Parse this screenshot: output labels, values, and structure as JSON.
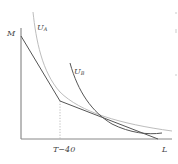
{
  "diagram": {
    "type": "labor-leisure budget constraint with indifference curves",
    "labels": {
      "y_axis": "M",
      "x_axis": "L",
      "kink_tick": "T−40",
      "curve_a": "U",
      "curve_a_sub": "A",
      "curve_b": "U",
      "curve_b_sub": "B"
    },
    "colors": {
      "axis": "#777777",
      "budget_line": "#555555",
      "curve_a": "#b8b8b8",
      "curve_b": "#555555",
      "dotted_guide": "#aaaaaa"
    }
  }
}
